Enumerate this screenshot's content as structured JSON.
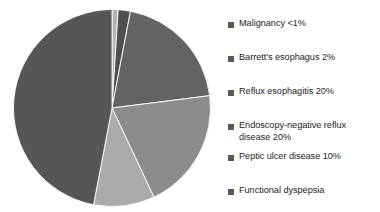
{
  "chart_data": {
    "type": "pie",
    "title": "",
    "subtitle": "",
    "xlabel": "",
    "ylabel": "",
    "legend_position": "right",
    "grid": false,
    "start_angle_deg": 0,
    "direction": "clockwise",
    "categories": [
      "Malignancy <1%",
      "Barrett's esophagus 2%",
      "Reflux esophagitis 20%",
      "Endoscopy-negative reflux disease 20%",
      "Peptic ulcer disease 10%",
      "Functional dyspepsia"
    ],
    "values": [
      1,
      2,
      20,
      20,
      10,
      47
    ],
    "colors": [
      "#b4b4b4",
      "#4f4f4f",
      "#636363",
      "#8c8c8c",
      "#ababab",
      "#565656"
    ],
    "slices": [
      {
        "label": "Malignancy <1%",
        "value": 1,
        "color": "#b4b4b4"
      },
      {
        "label": "Barrett's esophagus 2%",
        "value": 2,
        "color": "#4f4f4f"
      },
      {
        "label": "Reflux esophagitis 20%",
        "value": 20,
        "color": "#636363"
      },
      {
        "label": "Endoscopy-negative reflux disease 20%",
        "value": 20,
        "color": "#8c8c8c"
      },
      {
        "label": "Peptic ulcer disease 10%",
        "value": 10,
        "color": "#ababab"
      },
      {
        "label": "Functional dyspepsia",
        "value": 47,
        "color": "#565656"
      }
    ]
  },
  "legend": {
    "marker_color": "#595959",
    "items": [
      {
        "label": "Malignancy <1%"
      },
      {
        "label": "Barrett's esophagus 2%"
      },
      {
        "label": "Reflux esophagitis 20%"
      },
      {
        "label": "Endoscopy-negative reflux\ndisease 20%"
      },
      {
        "label": "Peptic ulcer disease 10%"
      },
      {
        "label": "Functional dyspepsia"
      }
    ]
  }
}
